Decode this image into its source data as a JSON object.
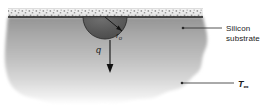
{
  "figure": {
    "background_color": "#ffffff",
    "width": 280,
    "height": 112
  },
  "colors": {
    "substrate_top": "#9a9a9a",
    "substrate_mid": "#b4b4b4",
    "substrate_bottom": "#ffffff",
    "hemisphere": "#5a5a5a",
    "surface_line": "#1a1a1a",
    "stipple_band": "#e8e8e8",
    "stipple_dot": "#8f8f8f",
    "leader_line": "#2a2a2a",
    "label_text": "#1a1a1a",
    "arrow": "#111111"
  },
  "labels": {
    "silicon_line1": "Silicon",
    "silicon_line2": "substrate",
    "ambient_symbol": "T",
    "ambient_subscript": "∞",
    "radius_symbol": "r",
    "radius_subscript": "o",
    "heat_symbol": "q"
  },
  "annotations": {
    "silicon_leader": {
      "dot_x": 183,
      "dot_y": 28,
      "end_x": 222,
      "end_y": 28
    },
    "ambient_leader": {
      "dot_x": 182,
      "dot_y": 83,
      "end_x": 234,
      "end_y": 83
    }
  },
  "geometry": {
    "surface_line_y": 17,
    "surface_line_x0": 8,
    "surface_line_x1": 203,
    "stipple_band_top": 8,
    "stipple_band_height": 9,
    "hemisphere_center_x": 105,
    "hemisphere_center_y": 17,
    "hemisphere_radius": 22,
    "heat_arrow_x": 110,
    "heat_arrow_y0": 40,
    "heat_arrow_y1": 72
  }
}
